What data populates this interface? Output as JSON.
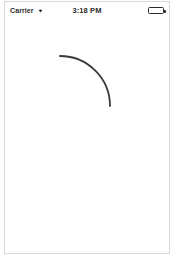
{
  "device": {
    "frame_border_color": "#d8d8d8",
    "background_color": "#ffffff"
  },
  "status_bar": {
    "carrier": "Carrier",
    "wifi_icon": "wifi-icon",
    "wifi_glyph": "▾",
    "time": "3:18 PM",
    "battery_icon": "battery-full-icon",
    "battery_level_percent": 100,
    "text_color": "#2b2b2b"
  },
  "content": {
    "shape": {
      "name": "quarter-arc",
      "type": "circular-arc",
      "center_x": 55,
      "center_y": 87,
      "radius": 50,
      "start_angle_deg": 0,
      "end_angle_deg": 90,
      "stroke_color": "#3a3a3a",
      "stroke_width": 1.8,
      "fill": "none",
      "path": "M 55 37 A 50 50 0 0 1 105 87"
    }
  }
}
